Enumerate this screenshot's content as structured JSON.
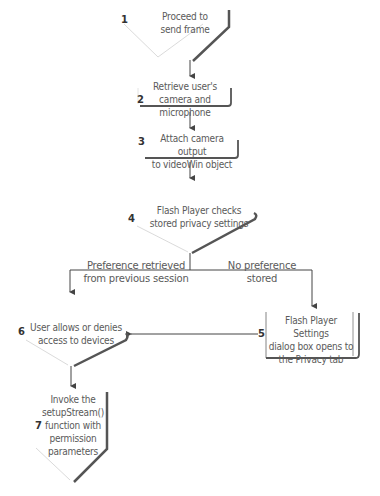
{
  "steps": [
    {
      "num": "1",
      "line1": "Proceed to",
      "line2": "send frame"
    },
    {
      "num": "2",
      "line1": "Retrieve user's",
      "line2": "camera and microphone"
    },
    {
      "num": "3",
      "line1": "Attach camera output",
      "line2": "to videoWin object"
    },
    {
      "num": "4",
      "line1": "Flash Player checks",
      "line2": "stored privacy settings"
    },
    {
      "num": "5",
      "line1": "Flash Player Settings",
      "line2": "dialog box opens to",
      "line3": "the Privacy tab"
    },
    {
      "num": "6",
      "line1": "User allows or denies",
      "line2": "access to devices"
    },
    {
      "num": "7",
      "line1": "Invoke the",
      "line2": "setupStream()",
      "line3": "function with",
      "line4": "permission",
      "line5": "parameters"
    }
  ],
  "branches": {
    "left": {
      "line1": "Preference retrieved",
      "line2": "from previous session"
    },
    "right": {
      "line1": "No preference",
      "line2": "stored"
    }
  },
  "colors": {
    "line": "#444444",
    "shadow": "#555555",
    "text": "#5a5a5a",
    "thin": "#cccccc"
  }
}
